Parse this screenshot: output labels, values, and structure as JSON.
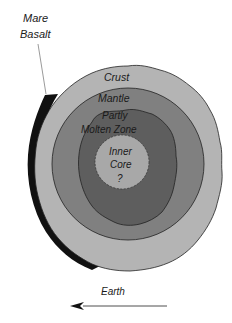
{
  "diagram": {
    "type": "cross-section",
    "labels": {
      "mare_basalt_line1": "Mare",
      "mare_basalt_line2": "Basalt",
      "crust": "Crust",
      "mantle": "Mantle",
      "partly_molten_line1": "Partly",
      "partly_molten_line2": "Molten Zone",
      "inner_core_line1": "Inner",
      "inner_core_line2": "Core",
      "inner_core_line3": "?",
      "earth": "Earth"
    },
    "layers": [
      {
        "name": "Mare Basalt",
        "color": "#111111"
      },
      {
        "name": "Crust",
        "color": "#b4b4b4"
      },
      {
        "name": "Mantle",
        "color": "#808080"
      },
      {
        "name": "Partly Molten Zone",
        "color": "#5e5e5e"
      },
      {
        "name": "Inner Core",
        "color": "#a8a8a8"
      }
    ],
    "arrow_direction": "left"
  }
}
